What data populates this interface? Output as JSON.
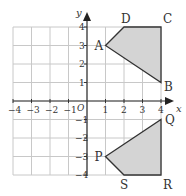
{
  "axes": {
    "x_label": "x",
    "y_label": "y",
    "origin_label": "O",
    "x_ticks": [
      "-4",
      "-3",
      "-2",
      "-1",
      "1",
      "2",
      "3",
      "4"
    ],
    "y_ticks": [
      "4",
      "3",
      "2",
      "1",
      "-1",
      "-2",
      "-3",
      "-4"
    ],
    "range": {
      "xmin": -4,
      "xmax": 4,
      "ymin": -4,
      "ymax": 4
    }
  },
  "shapes": [
    {
      "name": "ABCD",
      "vertices": [
        {
          "label": "A",
          "x": 1,
          "y": 3
        },
        {
          "label": "D",
          "x": 2,
          "y": 4
        },
        {
          "label": "C",
          "x": 4,
          "y": 4
        },
        {
          "label": "B",
          "x": 4,
          "y": 1
        }
      ],
      "fill": "#d4d4d4",
      "stroke": "#333333"
    },
    {
      "name": "PQRS",
      "vertices": [
        {
          "label": "P",
          "x": 1,
          "y": -3
        },
        {
          "label": "Q",
          "x": 4,
          "y": -1
        },
        {
          "label": "R",
          "x": 4,
          "y": -4
        },
        {
          "label": "S",
          "x": 2,
          "y": -4
        }
      ],
      "fill": "#d4d4d4",
      "stroke": "#333333"
    }
  ],
  "colors": {
    "grid": "#c8c8c8",
    "axis": "#333333",
    "fill": "#d4d4d4"
  }
}
